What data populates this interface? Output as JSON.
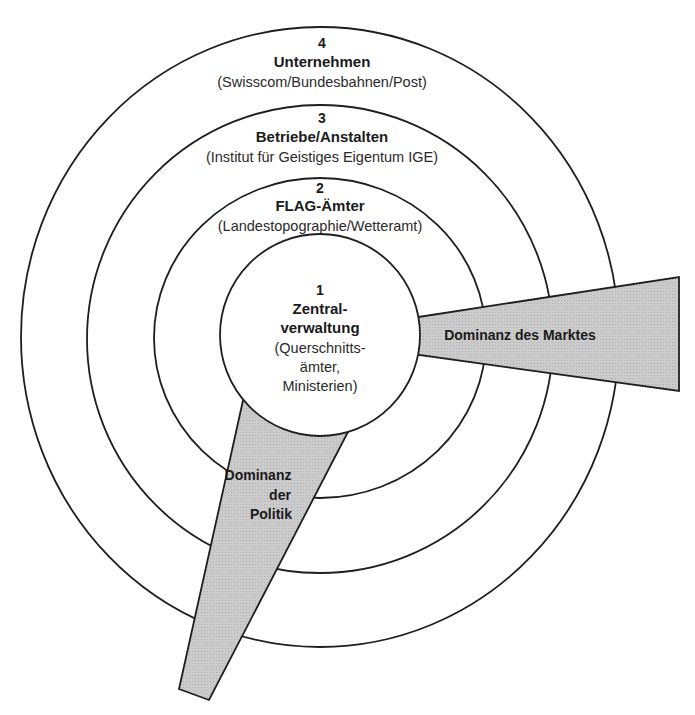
{
  "diagram": {
    "type": "concentric-circles",
    "center": {
      "x": 320,
      "y": 337
    },
    "colors": {
      "line": "#1e1e1e",
      "fill": "#ffffff",
      "wedge_fill": "#c8c8c8",
      "text": "#1a1a1a"
    },
    "rings": [
      {
        "level": "1",
        "title_line1": "Zentral-",
        "title_line2": "verwaltung",
        "sub_line1": "(Querschnitts-",
        "sub_line2": "ämter,",
        "sub_line3": "Ministerien)"
      },
      {
        "level": "2",
        "title": "FLAG-Ämter",
        "subtitle": "(Landestopographie/Wetteramt)"
      },
      {
        "level": "3",
        "title": "Betriebe/Anstalten",
        "subtitle": "(Institut für Geistiges Eigentum IGE)"
      },
      {
        "level": "4",
        "title": "Unternehmen",
        "subtitle": "(Swisscom/Bundesbahnen/Post)"
      }
    ],
    "wedges": {
      "market": {
        "label": "Dominanz des Marktes"
      },
      "politics": {
        "label_line1": "Dominanz",
        "label_line2": "der",
        "label_line3": "Politik"
      }
    }
  }
}
